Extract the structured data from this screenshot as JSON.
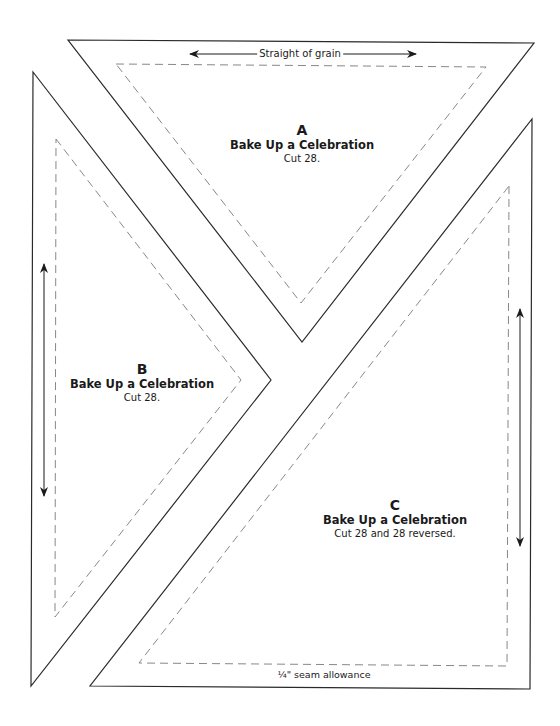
{
  "colors": {
    "cut_line": "#2a2a2a",
    "seam_line": "#888888",
    "text": "#1a1a1a",
    "background": "#ffffff"
  },
  "pieces": {
    "A": {
      "letter": "A",
      "title": "Bake Up a Celebration",
      "cut": "Cut 28."
    },
    "B": {
      "letter": "B",
      "title": "Bake Up a Celebration",
      "cut": "Cut 28."
    },
    "C": {
      "letter": "C",
      "title": "Bake Up a Celebration",
      "cut": "Cut 28 and 28 reversed."
    }
  },
  "annotations": {
    "grain": "Straight of grain",
    "seam": "¼\" seam allowance"
  },
  "icons": {
    "grain_arrow_a": "double-arrow-horizontal",
    "grain_arrow_b": "double-arrow-vertical",
    "grain_arrow_c": "double-arrow-vertical"
  }
}
